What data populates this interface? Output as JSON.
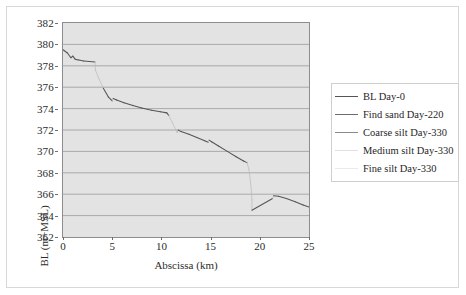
{
  "chart_data": {
    "type": "line",
    "title": "",
    "xlabel": "Abscissa (km)",
    "ylabel": "BL (m+MSL)",
    "xlim": [
      0,
      25
    ],
    "ylim": [
      362,
      382
    ],
    "xticks": [
      0,
      5,
      10,
      15,
      20,
      25
    ],
    "yticks": [
      362,
      364,
      366,
      368,
      370,
      372,
      374,
      376,
      378,
      380,
      382
    ],
    "grid": "horizontal",
    "legend_position": "right",
    "plot_background": "#e3e3e3",
    "line_color": "#555555",
    "faint_line_color": "#b9b9b9",
    "series": [
      {
        "name": "BL Day-0",
        "color": "#555555",
        "points": [
          [
            0.0,
            379.5
          ],
          [
            0.45,
            379.2
          ],
          [
            0.8,
            378.75
          ],
          [
            1.0,
            378.9
          ],
          [
            1.25,
            378.6
          ],
          [
            1.6,
            378.55
          ],
          [
            2.1,
            378.45
          ],
          [
            2.7,
            378.4
          ],
          [
            3.25,
            378.35
          ],
          [
            3.3,
            377.6
          ],
          [
            3.6,
            376.9
          ],
          [
            4.1,
            375.9
          ],
          [
            4.6,
            375.1
          ],
          [
            5.0,
            374.72
          ],
          [
            5.1,
            374.95
          ],
          [
            5.45,
            374.8
          ],
          [
            6.2,
            374.55
          ],
          [
            7.1,
            374.3
          ],
          [
            8.0,
            374.05
          ],
          [
            9.0,
            373.85
          ],
          [
            9.9,
            373.7
          ],
          [
            10.55,
            373.6
          ],
          [
            10.75,
            373.35
          ],
          [
            11.1,
            372.7
          ],
          [
            11.45,
            372.05
          ],
          [
            11.6,
            371.75
          ],
          [
            11.7,
            372.0
          ],
          [
            12.0,
            371.85
          ],
          [
            12.8,
            371.6
          ],
          [
            13.6,
            371.3
          ],
          [
            14.4,
            371.0
          ],
          [
            14.75,
            370.85
          ],
          [
            14.85,
            371.05
          ],
          [
            15.1,
            370.9
          ],
          [
            15.8,
            370.5
          ],
          [
            16.7,
            370.0
          ],
          [
            17.6,
            369.5
          ],
          [
            18.35,
            369.1
          ],
          [
            18.7,
            368.95
          ],
          [
            18.9,
            368.3
          ],
          [
            19.05,
            367.2
          ],
          [
            19.15,
            366.2
          ],
          [
            19.2,
            365.5
          ],
          [
            19.2,
            364.5
          ],
          [
            21.3,
            365.6
          ],
          [
            21.4,
            365.85
          ],
          [
            21.9,
            365.8
          ],
          [
            22.7,
            365.6
          ],
          [
            23.6,
            365.3
          ],
          [
            24.4,
            365.0
          ],
          [
            25.0,
            364.8
          ]
        ]
      }
    ],
    "legend_entries": [
      {
        "label": "BL Day-0",
        "swatch": "#555555",
        "visible_line": true
      },
      {
        "label": "Find sand Day-220",
        "swatch": "#6d6d6d",
        "visible_line": true
      },
      {
        "label": "Coarse silt Day-330",
        "swatch": "#8a8a8a",
        "visible_line": true
      },
      {
        "label": "Medium silt Day-330",
        "swatch": "#e0e0e0",
        "visible_line": false
      },
      {
        "label": "Fine silt Day-330",
        "swatch": "#eaeaea",
        "visible_line": false
      }
    ]
  },
  "axes": {
    "y_title": "BL (m+MSL)",
    "x_title": "Abscissa (km)",
    "y_tick_labels": [
      "382",
      "380",
      "378",
      "376",
      "374",
      "372",
      "370",
      "368",
      "366",
      "364",
      "362"
    ],
    "x_tick_labels": [
      "0",
      "5",
      "10",
      "15",
      "20",
      "25"
    ]
  },
  "legend": {
    "items": [
      {
        "label": "BL Day-0"
      },
      {
        "label": "Find sand Day-220"
      },
      {
        "label": "Coarse silt Day-330"
      },
      {
        "label": "Medium silt Day-330"
      },
      {
        "label": "Fine silt Day-330"
      }
    ]
  }
}
